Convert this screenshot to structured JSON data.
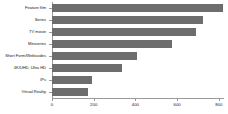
{
  "chart_data": {
    "type": "bar",
    "orientation": "horizontal",
    "title": "",
    "xlabel": "",
    "ylabel": "",
    "categories": [
      "Feature film",
      "Series",
      "TV movie",
      "Miniseries",
      "Short Form/Webisodes",
      "4K/UHD, Ultra HD",
      "IPs",
      "Virtual Reality"
    ],
    "values": [
      820,
      725,
      690,
      575,
      408,
      335,
      192,
      172
    ],
    "xticks": [
      0,
      200,
      400,
      600,
      800
    ],
    "xtick_labels": [
      "0",
      "200",
      "400",
      "600",
      "800"
    ],
    "xlim": [
      0,
      825
    ],
    "grid": false,
    "legend": null,
    "bar_color": "#6d6d6d",
    "axis_color": "#9a9a9a",
    "background": "#ffffff"
  }
}
